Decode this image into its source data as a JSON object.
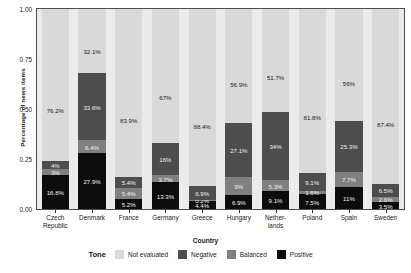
{
  "chart_data": {
    "type": "bar",
    "subtype": "stacked-100-percent",
    "title": "",
    "xlabel": "Country",
    "ylabel": "Percentage of news items",
    "ylim": [
      0,
      1
    ],
    "yticks": [
      "0.00",
      "0.25",
      "0.50",
      "0.75",
      "1.00"
    ],
    "ytick_values": [
      0,
      0.25,
      0.5,
      0.75,
      1
    ],
    "grid": false,
    "legend_title": "Tone",
    "legend_position": "bottom",
    "categories": [
      "Czech Republic",
      "Denmark",
      "France",
      "Germany",
      "Greece",
      "Hungary",
      "Netherlands",
      "Poland",
      "Spain",
      "Sweden"
    ],
    "category_lines": [
      [
        "Czech",
        "Republic"
      ],
      [
        "Denmark"
      ],
      [
        "France"
      ],
      [
        "Germany"
      ],
      [
        "Greece"
      ],
      [
        "Hungary"
      ],
      [
        "Nether-",
        "lands"
      ],
      [
        "Poland"
      ],
      [
        "Spain"
      ],
      [
        "Sweden"
      ]
    ],
    "series": [
      {
        "name": "Positive",
        "color": "#0d0d0d",
        "label_color": "light",
        "values": [
          16.8,
          27.9,
          5.2,
          13.3,
          4.4,
          6.9,
          9.1,
          7.5,
          11.0,
          3.5
        ],
        "labels": [
          "16.8%",
          "27.9%",
          "5.2%",
          "13.3%",
          "4.4%",
          "6.9%",
          "9.1%",
          "7.5%",
          "11%",
          "3.5%"
        ]
      },
      {
        "name": "Balanced",
        "color": "#808080",
        "label_color": "light",
        "values": [
          3.0,
          6.4,
          5.4,
          3.7,
          0.2,
          9.0,
          5.3,
          1.6,
          7.7,
          2.6
        ],
        "labels": [
          "3%",
          "6.4%",
          "5.4%",
          "3.7%",
          "0.2%",
          "9%",
          "5.3%",
          "1.6%",
          "7.7%",
          "2.6%"
        ]
      },
      {
        "name": "Negative",
        "color": "#4d4d4d",
        "label_color": "light",
        "values": [
          4.0,
          33.6,
          5.4,
          16.0,
          6.9,
          27.1,
          34.0,
          9.1,
          25.3,
          6.5
        ],
        "labels": [
          "4%",
          "33.6%",
          "5.4%",
          "16%",
          "6.9%",
          "27.1%",
          "34%",
          "9.1%",
          "25.3%",
          "6.5%"
        ]
      },
      {
        "name": "Not evaluated",
        "color": "#d9d9d9",
        "label_color": "dark",
        "values": [
          76.2,
          32.1,
          83.9,
          67.0,
          88.4,
          56.9,
          51.7,
          81.8,
          56.0,
          87.4
        ],
        "labels": [
          "76.2%",
          "32.1%",
          "83.9%",
          "67%",
          "88.4%",
          "56.9%",
          "51.7%",
          "81.8%",
          "56%",
          "87.4%"
        ]
      }
    ],
    "legend_entries": [
      {
        "label": "Not evaluated",
        "color": "#d9d9d9"
      },
      {
        "label": "Negative",
        "color": "#4d4d4d"
      },
      {
        "label": "Balanced",
        "color": "#808080"
      },
      {
        "label": "Positive",
        "color": "#0d0d0d"
      }
    ],
    "panel_background": "#ebebeb",
    "panel_border": "#4d4d4d"
  }
}
